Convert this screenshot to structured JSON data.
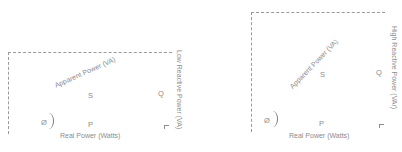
{
  "diagrams": [
    {
      "id": "low-reactive",
      "vertical_label": "Low Reactive Power (VA)",
      "hypotenuse_label": "Apparent Power (VA)",
      "horizontal_label": "Real Power (Watts)",
      "symbols": {
        "apparent": "S",
        "reactive": "Q",
        "real": "P",
        "angle": "Ø"
      }
    },
    {
      "id": "high-reactive",
      "vertical_label": "High Reactive Power (VAr)",
      "hypotenuse_label": "Apparent Power (VA)",
      "horizontal_label": "Real Power (Watts)",
      "symbols": {
        "apparent": "S",
        "reactive": "Q",
        "real": "P",
        "angle": "Ø"
      }
    }
  ]
}
